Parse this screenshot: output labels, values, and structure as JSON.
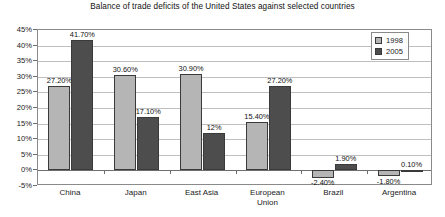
{
  "chart_data": {
    "type": "bar",
    "title": "Balance of trade deficits of the United States against selected countries",
    "xlabel": "",
    "ylabel": "",
    "ylim": [
      -5,
      45
    ],
    "ytick_step": 5,
    "ytick_labels": [
      "45%",
      "40%",
      "35%",
      "30%",
      "25%",
      "20%",
      "15%",
      "10%",
      "5%",
      "0%",
      "-5%"
    ],
    "grid": true,
    "legend_position": "top-right-inside",
    "categories": [
      "China",
      "Japan",
      "East Asia",
      "European\nUnion",
      "Brazil",
      "Argentina"
    ],
    "series": [
      {
        "name": "1998",
        "color": "#b5b5b5",
        "values": [
          27.2,
          30.6,
          30.9,
          15.4,
          -2.4,
          -1.8
        ],
        "labels": [
          "27.20%",
          "30.60%",
          "30.90%",
          "15.40%",
          "-2.40%",
          "-1.80%"
        ]
      },
      {
        "name": "2005",
        "color": "#4d4d4d",
        "values": [
          41.7,
          17.1,
          12.0,
          27.2,
          1.9,
          0.1
        ],
        "labels": [
          "41.70%",
          "17.10%",
          "12%",
          "27.20%",
          "1.90%",
          "0.10%"
        ]
      }
    ]
  }
}
